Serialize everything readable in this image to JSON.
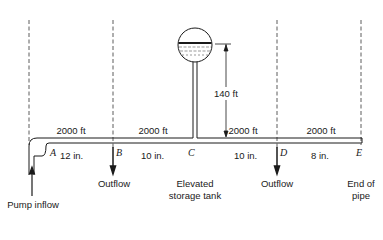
{
  "diagram": {
    "type": "pipeline-network",
    "segments": [
      {
        "from": "A",
        "to": "B",
        "length": "2000 ft",
        "diameter": "12 in."
      },
      {
        "from": "B",
        "to": "C",
        "length": "2000 ft",
        "diameter": "10 in."
      },
      {
        "from": "C",
        "to": "D",
        "length": "2000 ft",
        "diameter": "10 in."
      },
      {
        "from": "D",
        "to": "E",
        "length": "2000 ft",
        "diameter": "8 in."
      }
    ],
    "points": {
      "A": "A",
      "B": "B",
      "C": "C",
      "D": "D",
      "E": "E"
    },
    "tank_height": "140 ft",
    "labels": {
      "pump_inflow": "Pump inflow",
      "outflow_b": "Outflow",
      "tank_line1": "Elevated",
      "tank_line2": "storage tank",
      "outflow_d": "Outflow",
      "end_line1": "End of",
      "end_line2": "pipe"
    }
  }
}
